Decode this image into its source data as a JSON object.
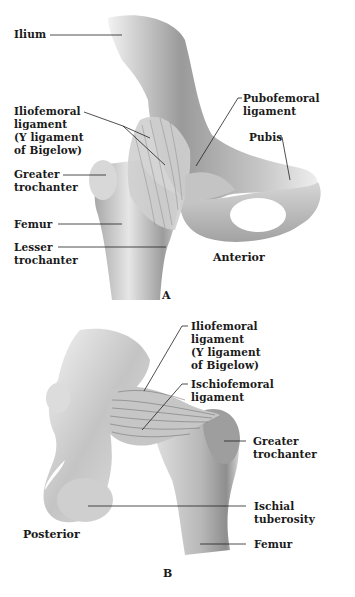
{
  "figure_a": {
    "panel_letter": "A",
    "view_label": "Anterior",
    "labels": {
      "ilium": "Ilium",
      "iliofemoral": "Iliofemoral\nligament\n(Y ligament\nof Bigelow)",
      "greater_trochanter": "Greater\ntrochanter",
      "femur": "Femur",
      "lesser_trochanter": "Lesser\ntrochanter",
      "pubofemoral": "Pubofemoral\nligament",
      "pubis": "Pubis"
    }
  },
  "figure_b": {
    "panel_letter": "B",
    "view_label": "Posterior",
    "labels": {
      "iliofemoral": "Iliofemoral\nligament\n(Y ligament\nof Bigelow)",
      "ischiofemoral": "Ischiofemoral\nligament",
      "greater_trochanter": "Greater\ntrochanter",
      "ischial_tuberosity": "Ischial\ntuberosity",
      "femur": "Femur"
    }
  },
  "colors": {
    "background": "#ffffff",
    "text": "#1a1a1a",
    "leader_line": "#222222",
    "bone_light": "#e8e8e8",
    "bone_mid": "#bdbdbd",
    "bone_dark": "#7a7a7a"
  }
}
